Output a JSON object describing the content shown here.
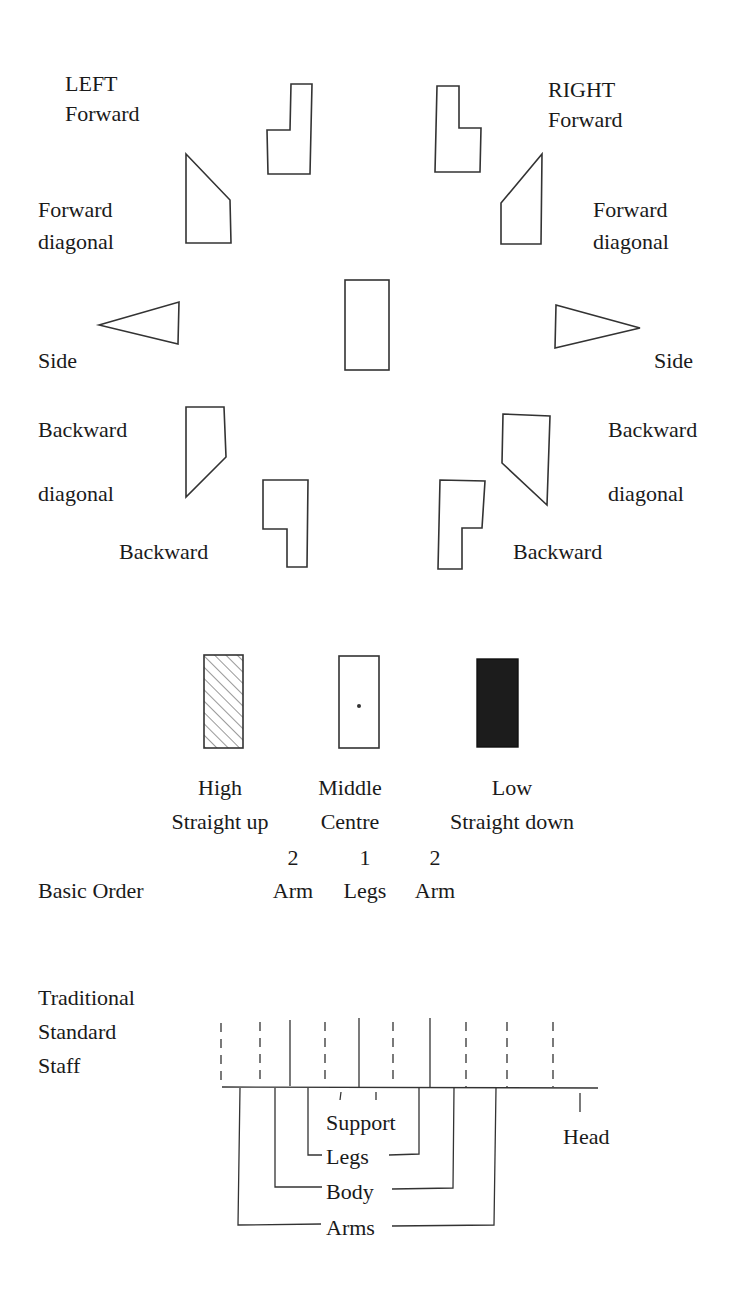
{
  "directions": {
    "left_header": "LEFT",
    "right_header": "RIGHT",
    "left": {
      "forward": "Forward",
      "forward_diagonal": [
        "Forward",
        "diagonal"
      ],
      "side": "Side",
      "backward_diagonal": [
        "Backward",
        "diagonal"
      ],
      "backward": "Backward"
    },
    "right": {
      "forward": "Forward",
      "forward_diagonal": [
        "Forward",
        "diagonal"
      ],
      "side": "Side",
      "backward_diagonal": [
        "Backward",
        "diagonal"
      ],
      "backward": "Backward"
    }
  },
  "levels": [
    {
      "name": "High",
      "description": "Straight up",
      "fill": "hatched"
    },
    {
      "name": "Middle",
      "description": "Centre",
      "fill": "dot"
    },
    {
      "name": "Low",
      "description": "Straight down",
      "fill": "#1a1a1a"
    }
  ],
  "basic_order": {
    "label": "Basic Order",
    "columns": [
      {
        "number": "2",
        "part": "Arm"
      },
      {
        "number": "1",
        "part": "Legs"
      },
      {
        "number": "2",
        "part": "Arm"
      }
    ]
  },
  "staff": {
    "title": [
      "Traditional",
      "Standard",
      "Staff"
    ],
    "labels": {
      "support": "Support",
      "legs": "Legs",
      "body": "Body",
      "arms": "Arms",
      "head": "Head"
    }
  }
}
